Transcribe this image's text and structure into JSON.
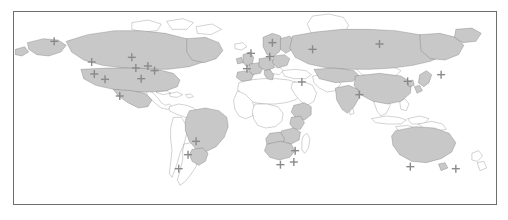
{
  "figure": {
    "type": "world-map",
    "projection": "equirectangular",
    "ocean_color": "#ffffff",
    "highlight_land_color": "#c8c8c8",
    "plain_land_color": "#ffffff",
    "outline_color": "#3c3c3c",
    "frame_color": "#6e6e6e",
    "marker_color": "#8a8a8a",
    "marker_shape": "plus-cross",
    "frame": {
      "left": 13,
      "top": 11,
      "width": 484,
      "height": 194
    },
    "lon_range": [
      -180,
      180
    ],
    "lat_range": [
      -60,
      84
    ]
  },
  "markers": [
    {
      "name": "alaska",
      "lon": -150.0,
      "lat": 62.0
    },
    {
      "name": "pacific-northwest",
      "lon": -122.0,
      "lat": 46.5
    },
    {
      "name": "california",
      "lon": -120.0,
      "lat": 37.5
    },
    {
      "name": "southwest-us",
      "lon": -112.0,
      "lat": 33.5
    },
    {
      "name": "central-canada",
      "lon": -92.0,
      "lat": 50.0
    },
    {
      "name": "midwest-us",
      "lon": -89.0,
      "lat": 42.0
    },
    {
      "name": "great-lakes-east",
      "lon": -80.0,
      "lat": 43.5
    },
    {
      "name": "southeast-us",
      "lon": -85.0,
      "lat": 34.0
    },
    {
      "name": "northeast-us",
      "lon": -75.0,
      "lat": 40.0
    },
    {
      "name": "mexico",
      "lon": -101.0,
      "lat": 21.0
    },
    {
      "name": "brazil-northeast",
      "lon": -44.0,
      "lat": -13.0
    },
    {
      "name": "brazil-southeast",
      "lon": -50.0,
      "lat": -23.0
    },
    {
      "name": "argentina-uruguay",
      "lon": -57.0,
      "lat": -33.5
    },
    {
      "name": "united-kingdom",
      "lon": -3.0,
      "lat": 53.0
    },
    {
      "name": "iberia",
      "lon": -6.0,
      "lat": 41.5
    },
    {
      "name": "scandinavia",
      "lon": 13.0,
      "lat": 61.0
    },
    {
      "name": "central-europe",
      "lon": 11.0,
      "lat": 50.5
    },
    {
      "name": "western-russia",
      "lon": 43.0,
      "lat": 56.0
    },
    {
      "name": "siberia",
      "lon": 93.0,
      "lat": 60.0
    },
    {
      "name": "israel",
      "lon": 35.0,
      "lat": 31.5
    },
    {
      "name": "india",
      "lon": 78.0,
      "lat": 22.0
    },
    {
      "name": "china",
      "lon": 114.0,
      "lat": 32.0
    },
    {
      "name": "japan",
      "lon": 139.0,
      "lat": 37.0
    },
    {
      "name": "southern-africa-west",
      "lon": 19.0,
      "lat": -30.5
    },
    {
      "name": "southern-africa-east",
      "lon": 29.0,
      "lat": -28.5
    },
    {
      "name": "zimbabwe",
      "lon": 30.0,
      "lat": -20.0
    },
    {
      "name": "australia-west",
      "lon": 116.0,
      "lat": -32.0
    },
    {
      "name": "australia-east",
      "lon": 150.0,
      "lat": -33.5
    }
  ],
  "highlighted_regions": [
    "United States",
    "Canada",
    "Mexico",
    "Brazil",
    "Argentina",
    "United Kingdom",
    "Ireland",
    "Spain",
    "Portugal",
    "France",
    "Germany",
    "Italy",
    "Norway",
    "Sweden",
    "Finland",
    "Poland",
    "Russia",
    "China",
    "India",
    "Japan",
    "South Korea",
    "South Africa",
    "Zimbabwe",
    "Namibia",
    "Botswana",
    "Kenya",
    "Tanzania",
    "Ethiopia",
    "Australia",
    "New Zealand"
  ]
}
